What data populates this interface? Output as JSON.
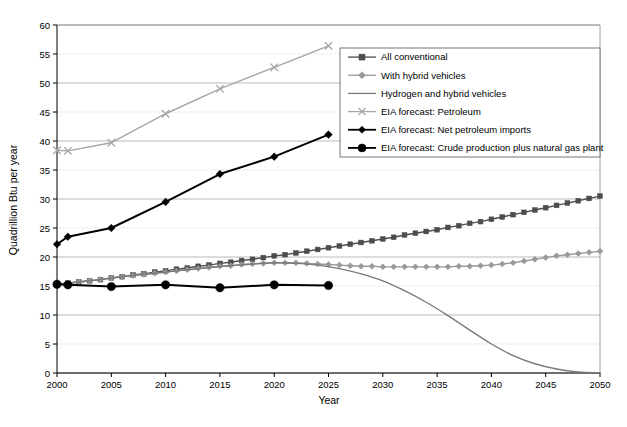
{
  "chart_data": {
    "type": "line",
    "title": "",
    "xlabel": "Year",
    "ylabel": "Quadrillion Btu per year",
    "xlim": [
      2000,
      2050
    ],
    "ylim": [
      0,
      60
    ],
    "xticks": [
      2000,
      2005,
      2010,
      2015,
      2020,
      2025,
      2030,
      2035,
      2040,
      2045,
      2050
    ],
    "yticks": [
      0,
      5,
      10,
      15,
      20,
      25,
      30,
      35,
      40,
      45,
      50,
      55,
      60
    ],
    "grid": true,
    "legend_position": "upper-right-inside",
    "series": [
      {
        "name": "All conventional",
        "color": "#4d4d4d",
        "marker": "square",
        "x": [
          2000,
          2001,
          2002,
          2003,
          2004,
          2005,
          2006,
          2007,
          2008,
          2009,
          2010,
          2011,
          2012,
          2013,
          2014,
          2015,
          2016,
          2017,
          2018,
          2019,
          2020,
          2021,
          2022,
          2023,
          2024,
          2025,
          2026,
          2027,
          2028,
          2029,
          2030,
          2031,
          2032,
          2033,
          2034,
          2035,
          2036,
          2037,
          2038,
          2039,
          2040,
          2041,
          2042,
          2043,
          2044,
          2045,
          2046,
          2047,
          2048,
          2049,
          2050
        ],
        "values": [
          15.3,
          15.5,
          15.7,
          15.9,
          16.1,
          16.4,
          16.6,
          16.9,
          17.1,
          17.4,
          17.6,
          17.9,
          18.1,
          18.4,
          18.6,
          18.9,
          19.1,
          19.4,
          19.6,
          19.9,
          20.2,
          20.4,
          20.7,
          21.0,
          21.3,
          21.6,
          21.9,
          22.2,
          22.5,
          22.8,
          23.1,
          23.4,
          23.8,
          24.1,
          24.4,
          24.7,
          25.1,
          25.4,
          25.8,
          26.1,
          26.5,
          26.9,
          27.3,
          27.7,
          28.1,
          28.5,
          28.9,
          29.3,
          29.7,
          30.1,
          30.5
        ]
      },
      {
        "name": "With hybrid vehicles",
        "color": "#999999",
        "marker": "diamond",
        "x": [
          2000,
          2001,
          2002,
          2003,
          2004,
          2005,
          2006,
          2007,
          2008,
          2009,
          2010,
          2011,
          2012,
          2013,
          2014,
          2015,
          2016,
          2017,
          2018,
          2019,
          2020,
          2021,
          2022,
          2023,
          2024,
          2025,
          2026,
          2027,
          2028,
          2029,
          2030,
          2031,
          2032,
          2033,
          2034,
          2035,
          2036,
          2037,
          2038,
          2039,
          2040,
          2041,
          2042,
          2043,
          2044,
          2045,
          2046,
          2047,
          2048,
          2049,
          2050
        ],
        "values": [
          15.3,
          15.5,
          15.7,
          15.9,
          16.1,
          16.4,
          16.6,
          16.8,
          17.0,
          17.2,
          17.4,
          17.6,
          17.8,
          18.0,
          18.2,
          18.4,
          18.5,
          18.7,
          18.8,
          18.9,
          19.0,
          19.0,
          19.0,
          18.9,
          18.8,
          18.7,
          18.6,
          18.5,
          18.4,
          18.4,
          18.3,
          18.3,
          18.3,
          18.3,
          18.3,
          18.3,
          18.3,
          18.4,
          18.4,
          18.5,
          18.6,
          18.8,
          19.0,
          19.3,
          19.6,
          19.9,
          20.2,
          20.4,
          20.6,
          20.8,
          21.0
        ]
      },
      {
        "name": "Hydrogen and hybrid vehicles",
        "color": "#7a7a7a",
        "marker": "none",
        "x": [
          2000,
          2002,
          2004,
          2006,
          2008,
          2010,
          2012,
          2014,
          2016,
          2018,
          2020,
          2022,
          2024,
          2026,
          2028,
          2030,
          2032,
          2034,
          2036,
          2038,
          2040,
          2042,
          2044,
          2046,
          2048,
          2050
        ],
        "values": [
          15.3,
          15.7,
          16.1,
          16.6,
          17.0,
          17.4,
          17.8,
          18.2,
          18.5,
          18.8,
          19.0,
          18.9,
          18.6,
          18.0,
          17.1,
          15.9,
          14.2,
          12.2,
          9.9,
          7.4,
          5.0,
          3.0,
          1.6,
          0.7,
          0.2,
          0.05
        ]
      },
      {
        "name": "EIA forecast: Petroleum",
        "color": "#a6a6a6",
        "marker": "x",
        "x": [
          2000,
          2001,
          2005,
          2010,
          2015,
          2020,
          2025
        ],
        "values": [
          38.4,
          38.3,
          39.7,
          44.7,
          49.0,
          52.7,
          56.4
        ]
      },
      {
        "name": "EIA forecast: Net petroleum imports",
        "color": "#000000",
        "marker": "diamond",
        "x": [
          2000,
          2001,
          2005,
          2010,
          2015,
          2020,
          2025
        ],
        "values": [
          22.2,
          23.5,
          25.0,
          29.5,
          34.3,
          37.3,
          41.1
        ]
      },
      {
        "name": "EIA forecast: Crude production plus natural gas plant",
        "color": "#000000",
        "marker": "circle",
        "x": [
          2000,
          2001,
          2005,
          2010,
          2015,
          2020,
          2025
        ],
        "values": [
          15.3,
          15.2,
          14.9,
          15.2,
          14.7,
          15.2,
          15.1
        ]
      }
    ]
  },
  "axes": {
    "y_title": "Quadrillion Btu per year",
    "x_title": "Year",
    "y_tick_labels": [
      "60",
      "55",
      "50",
      "45",
      "40",
      "35",
      "30",
      "25",
      "20",
      "15",
      "10",
      "5",
      "0"
    ],
    "x_tick_labels": [
      "2000",
      "2005",
      "2010",
      "2015",
      "2020",
      "2025",
      "2030",
      "2035",
      "2040",
      "2045",
      "2050"
    ]
  },
  "legend": {
    "entries": [
      {
        "label": "All conventional",
        "color": "#4d4d4d",
        "marker": "square"
      },
      {
        "label": "With hybrid vehicles",
        "color": "#999999",
        "marker": "diamond"
      },
      {
        "label": "Hydrogen and hybrid vehicles",
        "color": "#7a7a7a",
        "marker": "none"
      },
      {
        "label": "EIA forecast: Petroleum",
        "color": "#a6a6a6",
        "marker": "x"
      },
      {
        "label": "EIA forecast: Net petroleum imports",
        "color": "#000000",
        "marker": "diamond"
      },
      {
        "label": "EIA forecast: Crude production plus natural gas plant",
        "color": "#000000",
        "marker": "circle"
      }
    ]
  },
  "caption": {
    "text": ""
  }
}
